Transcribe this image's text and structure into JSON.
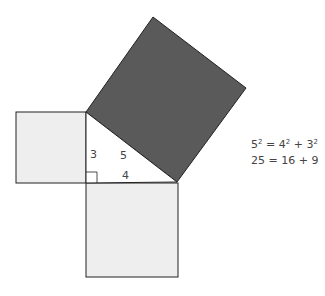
{
  "diagram": {
    "labels": {
      "side_a": "3",
      "side_b": "4",
      "side_c": "5"
    },
    "colors": {
      "hypotenuse_square": "#5a5a5a",
      "leg_squares": "#eeeeee",
      "stroke": "#222222"
    }
  },
  "equation": {
    "line1": {
      "c": "5",
      "eq": " = ",
      "b": "4",
      "plus": " + ",
      "a": "3",
      "exp": "2"
    },
    "line2": "25 = 16 + 9"
  }
}
